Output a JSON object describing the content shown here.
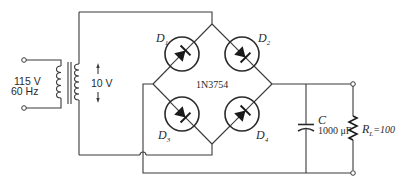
{
  "source": {
    "voltage": "115 V",
    "frequency": "60 Hz"
  },
  "transformer": {
    "secondary_voltage": "10 V"
  },
  "bridge": {
    "part_number": "1N3754",
    "diodes": [
      {
        "label": "D",
        "sub": "1"
      },
      {
        "label": "D",
        "sub": "2"
      },
      {
        "label": "D",
        "sub": "3"
      },
      {
        "label": "D",
        "sub": "4"
      }
    ]
  },
  "capacitor": {
    "label": "C",
    "value": "1000 μF"
  },
  "load": {
    "label": "R",
    "sub": "L",
    "value": "=100"
  },
  "colors": {
    "line": "#3a3a3a",
    "background": "#ffffff"
  }
}
